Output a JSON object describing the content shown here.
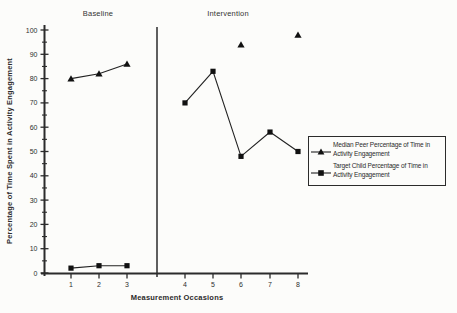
{
  "colors": {
    "ink": "#2b2b2b",
    "background": "#fcfcfa"
  },
  "chart_data": {
    "type": "line",
    "title": "",
    "xlabel": "Measurement Occasions",
    "ylabel": "Percentage of Time Spent in Activity Engagement",
    "x_ticks": [
      1,
      2,
      3,
      4,
      5,
      6,
      7,
      8
    ],
    "y_ticks": [
      0,
      10,
      20,
      30,
      40,
      50,
      60,
      70,
      80,
      90,
      100
    ],
    "y_minor_step": 5,
    "ylim": [
      0,
      100
    ],
    "grid": false,
    "phase_separator_after_occasion": 3,
    "phases": [
      {
        "label": "Baseline",
        "occasions": [
          1,
          3
        ]
      },
      {
        "label": "Intervention",
        "occasions": [
          4,
          8
        ]
      }
    ],
    "legend_position": "right-middle",
    "series": [
      {
        "name": "Median Peer Percentage of Time in Activity  Engagement",
        "marker": "triangle",
        "color": "#222222",
        "segments": [
          {
            "x": [
              1,
              2,
              3
            ],
            "y": [
              80,
              82,
              86
            ],
            "connected": true
          },
          {
            "x": [
              6
            ],
            "y": [
              94
            ],
            "connected": false
          },
          {
            "x": [
              8
            ],
            "y": [
              98
            ],
            "connected": false
          }
        ]
      },
      {
        "name": "Target Child Percentage of Time in Activity  Engagement",
        "marker": "square",
        "color": "#222222",
        "segments": [
          {
            "x": [
              1,
              2,
              3
            ],
            "y": [
              2,
              3,
              3
            ],
            "connected": true
          },
          {
            "x": [
              4,
              5,
              6,
              7,
              8
            ],
            "y": [
              70,
              83,
              48,
              58,
              50
            ],
            "connected": true
          }
        ]
      }
    ]
  }
}
